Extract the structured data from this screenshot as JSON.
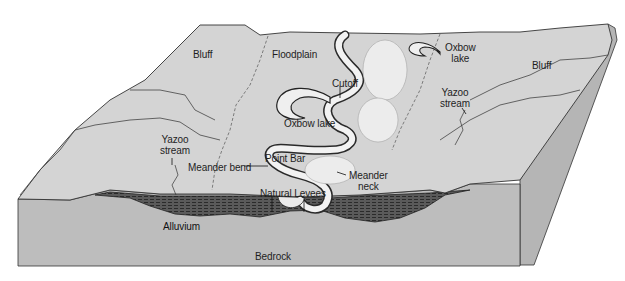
{
  "diagram": {
    "type": "block-diagram",
    "colors": {
      "surface": "#cfcfcf",
      "surface_light": "#e9e9e9",
      "side_face": "#b3b3b3",
      "alluvium": "#4a4a4a",
      "outline": "#2a2a2a",
      "background": "#ffffff"
    },
    "labels": {
      "bluff_left": "Bluff",
      "floodplain": "Floodplain",
      "oxbow_lake_top_line1": "Oxbow",
      "oxbow_lake_top_line2": "lake",
      "bluff_right": "Bluff",
      "cutoff": "Cutoff",
      "yazoo_right_line1": "Yazoo",
      "yazoo_right_line2": "stream",
      "oxbow_lake_mid": "Oxbow lake",
      "yazoo_left_line1": "Yazoo",
      "yazoo_left_line2": "stream",
      "point_bar": "Point Bar",
      "meander_bend": "Meander bend",
      "meander_neck_line1": "Meander",
      "meander_neck_line2": "neck",
      "natural_levees": "Natural Levees",
      "alluvium": "Alluvium",
      "bedrock": "Bedrock"
    }
  }
}
